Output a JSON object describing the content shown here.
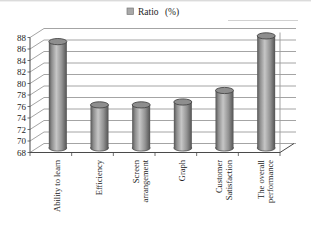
{
  "figure": {
    "background": "#ffffff"
  },
  "chart_data": {
    "type": "bar",
    "style": "3d-cylinder",
    "title": "",
    "xlabel": "",
    "ylabel": "",
    "legend": {
      "label": "Ratio (%)",
      "position": "top"
    },
    "categories": [
      "Ability to learn",
      "Efficiency",
      "Screen arrangement",
      "Graph",
      "Customer Satisfaction",
      "The overall performance"
    ],
    "category_lines": [
      [
        "Ability to learn"
      ],
      [
        "Efficiency"
      ],
      [
        "Screen",
        "arrangement"
      ],
      [
        "Graph"
      ],
      [
        "Customer",
        "Satisfaction"
      ],
      [
        "The overall",
        "performance"
      ]
    ],
    "series": [
      {
        "name": "Ratio (%)",
        "values": [
          86.5,
          75.5,
          75.5,
          76,
          78,
          87.5
        ]
      }
    ],
    "ylim": [
      68,
      88
    ],
    "ytick_step": 2,
    "yticks": [
      68,
      70,
      72,
      74,
      76,
      78,
      80,
      82,
      84,
      86,
      88
    ],
    "grid": true,
    "colors": {
      "bar_edge_dark": "#585858",
      "bar_side_mid": "#8d8d8d",
      "bar_center_light": "#c6c6c6",
      "bar_cap": "#8e8e8e",
      "cap_outline": "#474747",
      "grid_line": "#9a9a9a",
      "axis_line": "#4a4a4a",
      "text": "#1c1c1c",
      "legend_swatch": "#a8a8a8",
      "artifact_line": "#cccccc"
    }
  }
}
